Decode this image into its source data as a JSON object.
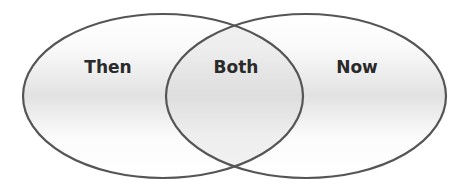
{
  "diagram": {
    "type": "venn",
    "sets": [
      {
        "id": "left",
        "label": "Then"
      },
      {
        "id": "right",
        "label": "Now"
      }
    ],
    "intersection": {
      "label": "Both"
    },
    "colors": {
      "stroke": "#555555",
      "fill_light": "#ffffff",
      "fill_mid": "#e4e4e4",
      "text": "#2a2a2a"
    }
  }
}
